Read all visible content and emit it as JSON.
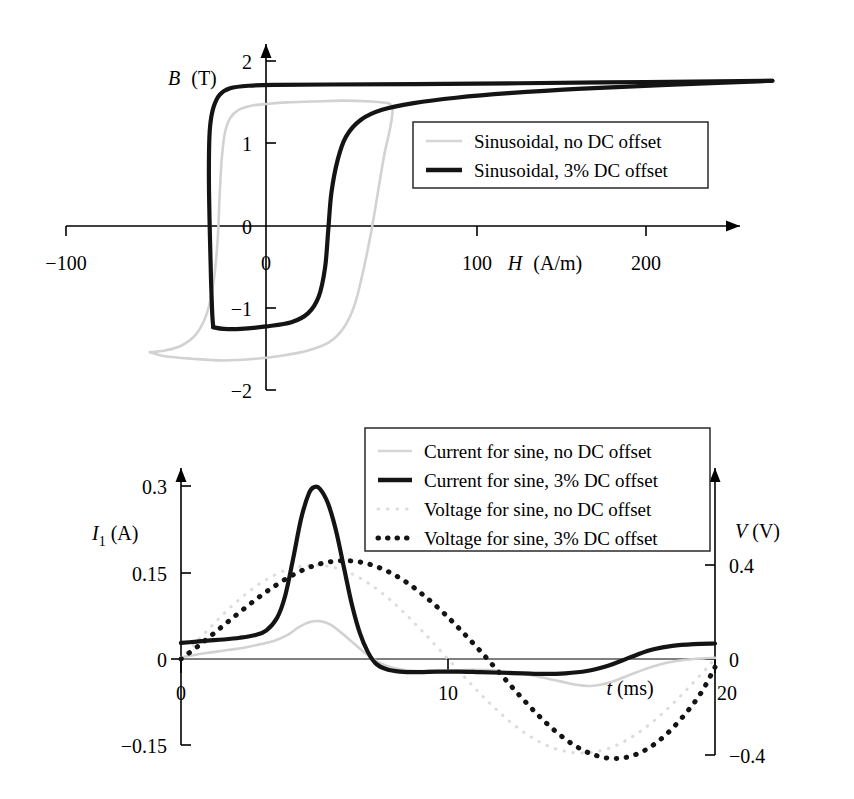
{
  "figure": {
    "panels": [
      "hysteresis",
      "waveform"
    ]
  },
  "chart_data": [
    {
      "id": "hysteresis",
      "type": "line",
      "title": "",
      "xlabel": "H (A/m)",
      "ylabel": "B (T)",
      "xlabel_symbol": "H",
      "xlabel_unit": "(A/m)",
      "ylabel_symbol": "B",
      "ylabel_unit": "(T)",
      "xlim": [
        -110,
        255
      ],
      "ylim": [
        -2.1,
        2.15
      ],
      "xticks": [
        -100,
        0,
        100,
        200
      ],
      "xtick_labels": [
        "-100",
        "0",
        "100",
        "200"
      ],
      "yticks": [
        2,
        1,
        0,
        -1,
        -2
      ],
      "ytick_labels": [
        "2",
        "1",
        "0",
        "-1",
        "-2"
      ],
      "grid": false,
      "legend_position": "center-right",
      "series": [
        {
          "name": "Sinusoidal, no DC offset",
          "style": "solid-light",
          "color": "#d2d2d2",
          "points_upper": [
            [
              -55,
              -1.52
            ],
            [
              -48,
              -1.5
            ],
            [
              -40,
              -1.44
            ],
            [
              -33,
              -1.3
            ],
            [
              -28,
              -1.05
            ],
            [
              -25,
              -0.7
            ],
            [
              -23,
              -0.2
            ],
            [
              -22,
              0.35
            ],
            [
              -21,
              0.8
            ],
            [
              -19.5,
              1.12
            ],
            [
              -17,
              1.3
            ],
            [
              -13,
              1.4
            ],
            [
              -7,
              1.45
            ],
            [
              0,
              1.47
            ],
            [
              10,
              1.49
            ],
            [
              22,
              1.5
            ],
            [
              36,
              1.51
            ],
            [
              50,
              1.5
            ],
            [
              58,
              1.48
            ]
          ],
          "points_lower": [
            [
              58,
              1.48
            ],
            [
              60,
              1.42
            ],
            [
              59,
              1.2
            ],
            [
              56,
              0.85
            ],
            [
              53,
              0.4
            ],
            [
              50,
              -0.05
            ],
            [
              46,
              -0.55
            ],
            [
              42,
              -0.95
            ],
            [
              37,
              -1.22
            ],
            [
              30,
              -1.4
            ],
            [
              20,
              -1.5
            ],
            [
              8,
              -1.56
            ],
            [
              -5,
              -1.6
            ],
            [
              -20,
              -1.62
            ],
            [
              -35,
              -1.6
            ],
            [
              -48,
              -1.57
            ],
            [
              -55,
              -1.52
            ]
          ]
        },
        {
          "name": "Sinusoidal, 3% DC offset",
          "style": "solid-dark",
          "color": "#141414",
          "points_upper": [
            [
              -25,
              -1.22
            ],
            [
              -25.5,
              -1.05
            ],
            [
              -26,
              -0.7
            ],
            [
              -26.5,
              -0.2
            ],
            [
              -27,
              0.4
            ],
            [
              -27,
              0.9
            ],
            [
              -26.5,
              1.2
            ],
            [
              -25,
              1.42
            ],
            [
              -22,
              1.58
            ],
            [
              -17,
              1.66
            ],
            [
              -8,
              1.69
            ],
            [
              5,
              1.7
            ],
            [
              30,
              1.705
            ],
            [
              70,
              1.71
            ],
            [
              120,
              1.72
            ],
            [
              180,
              1.735
            ],
            [
              240,
              1.75
            ]
          ],
          "points_lower": [
            [
              240,
              1.75
            ],
            [
              190,
              1.7
            ],
            [
              150,
              1.655
            ],
            [
              115,
              1.6
            ],
            [
              90,
              1.545
            ],
            [
              70,
              1.48
            ],
            [
              55,
              1.4
            ],
            [
              45,
              1.28
            ],
            [
              38,
              1.08
            ],
            [
              34,
              0.8
            ],
            [
              31,
              0.4
            ],
            [
              29.5,
              -0.05
            ],
            [
              28,
              -0.5
            ],
            [
              25,
              -0.85
            ],
            [
              20,
              -1.05
            ],
            [
              12,
              -1.16
            ],
            [
              0,
              -1.21
            ],
            [
              -12,
              -1.24
            ],
            [
              -20,
              -1.24
            ],
            [
              -25,
              -1.22
            ]
          ]
        }
      ]
    },
    {
      "id": "waveform",
      "type": "line",
      "title": "",
      "xlabel": "t (ms)",
      "xlabel_symbol": "t",
      "xlabel_unit": "(ms)",
      "ylabel_left": "I1 (A)",
      "ylabel_left_symbol": "I",
      "ylabel_left_sub": "1",
      "ylabel_left_unit": "(A)",
      "ylabel_right": "V (V)",
      "ylabel_right_symbol": "V",
      "ylabel_right_unit": "(V)",
      "xlim": [
        0,
        20
      ],
      "ylim_left": [
        -0.15,
        0.32
      ],
      "ylim_right": [
        -0.45,
        0.72
      ],
      "xticks": [
        0,
        10,
        20
      ],
      "xtick_labels": [
        "0",
        "10",
        "20"
      ],
      "yticks_left": [
        0.3,
        0.15,
        0,
        -0.15
      ],
      "ytick_labels_left": [
        "0.3",
        "0.15",
        "0",
        "-0.15"
      ],
      "yticks_right": [
        0.4,
        0,
        -0.4
      ],
      "ytick_labels_right": [
        "0.4",
        "0",
        "-0.4"
      ],
      "grid": false,
      "legend_position": "top-right",
      "series": [
        {
          "name": "Current for sine, no DC offset",
          "axis": "left",
          "style": "solid-light",
          "color": "#d2d2d2",
          "points": [
            [
              0,
              0.003
            ],
            [
              0.6,
              0.008
            ],
            [
              1.2,
              0.012
            ],
            [
              1.8,
              0.016
            ],
            [
              2.4,
              0.02
            ],
            [
              3.0,
              0.026
            ],
            [
              3.5,
              0.032
            ],
            [
              4.0,
              0.042
            ],
            [
              4.4,
              0.055
            ],
            [
              4.8,
              0.064
            ],
            [
              5.2,
              0.066
            ],
            [
              5.6,
              0.06
            ],
            [
              6.0,
              0.046
            ],
            [
              6.4,
              0.03
            ],
            [
              6.8,
              0.014
            ],
            [
              7.2,
              0.0
            ],
            [
              7.6,
              -0.01
            ],
            [
              8.0,
              -0.016
            ],
            [
              8.6,
              -0.02
            ],
            [
              9.4,
              -0.021
            ],
            [
              10.2,
              -0.02
            ],
            [
              11.0,
              -0.019
            ],
            [
              11.8,
              -0.02
            ],
            [
              12.6,
              -0.024
            ],
            [
              13.4,
              -0.031
            ],
            [
              14.2,
              -0.039
            ],
            [
              14.8,
              -0.045
            ],
            [
              15.3,
              -0.047
            ],
            [
              15.8,
              -0.044
            ],
            [
              16.3,
              -0.037
            ],
            [
              16.8,
              -0.028
            ],
            [
              17.3,
              -0.019
            ],
            [
              17.9,
              -0.01
            ],
            [
              18.5,
              -0.004
            ],
            [
              19.2,
              0.0
            ],
            [
              20,
              0.002
            ]
          ]
        },
        {
          "name": "Current for sine, 3% DC offset",
          "axis": "left",
          "style": "solid-dark",
          "color": "#141414",
          "points": [
            [
              0,
              0.028
            ],
            [
              0.5,
              0.03
            ],
            [
              1.0,
              0.032
            ],
            [
              1.6,
              0.034
            ],
            [
              2.2,
              0.037
            ],
            [
              2.8,
              0.042
            ],
            [
              3.2,
              0.05
            ],
            [
              3.6,
              0.072
            ],
            [
              3.9,
              0.11
            ],
            [
              4.2,
              0.175
            ],
            [
              4.5,
              0.245
            ],
            [
              4.8,
              0.29
            ],
            [
              5.0,
              0.3
            ],
            [
              5.2,
              0.297
            ],
            [
              5.5,
              0.272
            ],
            [
              5.8,
              0.225
            ],
            [
              6.1,
              0.16
            ],
            [
              6.4,
              0.095
            ],
            [
              6.7,
              0.045
            ],
            [
              7.0,
              0.012
            ],
            [
              7.3,
              -0.008
            ],
            [
              7.7,
              -0.018
            ],
            [
              8.2,
              -0.022
            ],
            [
              8.8,
              -0.023
            ],
            [
              9.6,
              -0.022
            ],
            [
              10.4,
              -0.022
            ],
            [
              11.2,
              -0.023
            ],
            [
              12.0,
              -0.024
            ],
            [
              12.8,
              -0.025
            ],
            [
              13.6,
              -0.026
            ],
            [
              14.4,
              -0.025
            ],
            [
              15.2,
              -0.021
            ],
            [
              15.9,
              -0.013
            ],
            [
              16.5,
              -0.003
            ],
            [
              17.1,
              0.008
            ],
            [
              17.7,
              0.017
            ],
            [
              18.4,
              0.023
            ],
            [
              19.2,
              0.026
            ],
            [
              20,
              0.027
            ]
          ]
        },
        {
          "name": "Voltage for sine, no DC offset",
          "axis": "right",
          "style": "dotted-light",
          "color": "#dcdcdc",
          "points": [
            [
              0,
              0.0
            ],
            [
              1,
              0.123
            ],
            [
              2,
              0.235
            ],
            [
              3,
              0.324
            ],
            [
              4,
              0.381
            ],
            [
              5,
              0.4
            ],
            [
              6,
              0.381
            ],
            [
              7,
              0.324
            ],
            [
              8,
              0.235
            ],
            [
              9,
              0.123
            ],
            [
              10,
              0.0
            ],
            [
              11,
              -0.123
            ],
            [
              12,
              -0.235
            ],
            [
              13,
              -0.324
            ],
            [
              14,
              -0.381
            ],
            [
              15,
              -0.4
            ],
            [
              16,
              -0.381
            ],
            [
              17,
              -0.324
            ],
            [
              18,
              -0.235
            ],
            [
              19,
              -0.123
            ],
            [
              20,
              0.0
            ]
          ]
        },
        {
          "name": "Voltage for sine, 3% DC offset",
          "axis": "right",
          "style": "dotted-dark",
          "color": "#141414",
          "points": [
            [
              0,
              0.0
            ],
            [
              0.7,
              0.06
            ],
            [
              1.4,
              0.125
            ],
            [
              2.1,
              0.19
            ],
            [
              2.8,
              0.253
            ],
            [
              3.5,
              0.31
            ],
            [
              4.2,
              0.358
            ],
            [
              4.9,
              0.394
            ],
            [
              5.6,
              0.414
            ],
            [
              6.3,
              0.418
            ],
            [
              7.0,
              0.405
            ],
            [
              7.7,
              0.375
            ],
            [
              8.4,
              0.33
            ],
            [
              9.1,
              0.27
            ],
            [
              9.8,
              0.2
            ],
            [
              10.5,
              0.12
            ],
            [
              11.2,
              0.035
            ],
            [
              11.9,
              -0.055
            ],
            [
              12.6,
              -0.145
            ],
            [
              13.3,
              -0.23
            ],
            [
              14.0,
              -0.305
            ],
            [
              14.7,
              -0.365
            ],
            [
              15.4,
              -0.405
            ],
            [
              16.1,
              -0.423
            ],
            [
              16.8,
              -0.415
            ],
            [
              17.5,
              -0.38
            ],
            [
              18.2,
              -0.318
            ],
            [
              18.9,
              -0.232
            ],
            [
              19.5,
              -0.14
            ],
            [
              20,
              -0.035
            ]
          ]
        }
      ]
    }
  ],
  "hysteresis_legend": {
    "items": [
      {
        "label": "Sinusoidal, no DC offset",
        "style": "solid-light"
      },
      {
        "label": "Sinusoidal, 3% DC offset",
        "style": "solid-dark"
      }
    ]
  },
  "waveform_legend": {
    "items": [
      {
        "label": "Current for sine, no DC offset",
        "style": "solid-light"
      },
      {
        "label": "Current for sine, 3% DC offset",
        "style": "solid-dark"
      },
      {
        "label": "Voltage for sine, no DC offset",
        "style": "dotted-light"
      },
      {
        "label": "Voltage for sine, 3% DC offset",
        "style": "dotted-dark"
      }
    ]
  },
  "hysteresis_axis_labels": {
    "y_symbol": "B",
    "y_unit": "(T)",
    "x_symbol": "H",
    "x_unit": "(A/m)",
    "ytick_2": "2",
    "ytick_1": "1",
    "ytick_0": "0",
    "ytick_m1": "−1",
    "ytick_m2": "−2",
    "xtick_m100": "−100",
    "xtick_0": "0",
    "xtick_100": "100",
    "xtick_200": "200"
  },
  "waveform_axis_labels": {
    "y_left_symbol": "I",
    "y_left_sub": "1",
    "y_left_unit": "(A)",
    "y_right_symbol": "V",
    "y_right_unit": "(V)",
    "x_symbol": "t",
    "x_unit": "(ms)",
    "ytick_l_03": "0.3",
    "ytick_l_015": "0.15",
    "ytick_l_0": "0",
    "ytick_l_m015": "−0.15",
    "ytick_r_04": "0.4",
    "ytick_r_0": "0",
    "ytick_r_m04": "−0.4",
    "xtick_0": "0",
    "xtick_10": "10",
    "xtick_20": "20"
  }
}
